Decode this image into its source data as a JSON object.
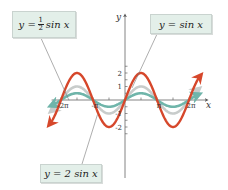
{
  "chart_data": {
    "type": "line",
    "title": "",
    "xlabel": "x",
    "ylabel": "y",
    "xlim": [
      -7.5,
      7.5
    ],
    "ylim": [
      -3,
      3
    ],
    "x_ticks": [
      {
        "value": -6.2832,
        "label": "-2π"
      },
      {
        "value": -4.7124,
        "label": ""
      },
      {
        "value": -3.1416,
        "label": "-π"
      },
      {
        "value": -1.5708,
        "label": ""
      },
      {
        "value": 1.5708,
        "label": ""
      },
      {
        "value": 3.1416,
        "label": "π"
      },
      {
        "value": 4.7124,
        "label": ""
      },
      {
        "value": 6.2832,
        "label": "2π"
      }
    ],
    "y_ticks": [
      {
        "value": 2.5,
        "label": ""
      },
      {
        "value": 2,
        "label": "2"
      },
      {
        "value": 1.5,
        "label": ""
      },
      {
        "value": 1,
        "label": "1"
      },
      {
        "value": 0.5,
        "label": ""
      },
      {
        "value": -0.5,
        "label": ""
      },
      {
        "value": -1,
        "label": "-1"
      },
      {
        "value": -1.5,
        "label": ""
      },
      {
        "value": -2,
        "label": "-2"
      },
      {
        "value": -2.5,
        "label": ""
      }
    ],
    "grid": false,
    "series": [
      {
        "name": "y = sin x",
        "amplitude": 1,
        "color": "#c8cccb",
        "x_range": [
          -7.2,
          7.2
        ]
      },
      {
        "name": "y = 1/2 sin x",
        "amplitude": 0.5,
        "color": "#6fb5aa",
        "x_range": [
          -7.2,
          7.2
        ]
      },
      {
        "name": "y = 2 sin x",
        "amplitude": 2,
        "color": "#d6472b",
        "x_range": [
          -7.4,
          7.4
        ]
      }
    ],
    "annotations": [
      {
        "id": "half",
        "text_prefix": "y = ",
        "frac_num": "1",
        "frac_den": "2",
        "text_suffix": "sin x",
        "points_to_series": "y = 1/2 sin x"
      },
      {
        "id": "one",
        "text": "y = sin x",
        "points_to_series": "y = sin x"
      },
      {
        "id": "two",
        "text": "y = 2 sin x",
        "points_to_series": "y = 2 sin x"
      }
    ]
  },
  "labels": {
    "half_prefix": "y =",
    "half_num": "1",
    "half_den": "2",
    "half_suffix": "sin x",
    "one": "y = sin x",
    "two": "y = 2 sin x"
  }
}
